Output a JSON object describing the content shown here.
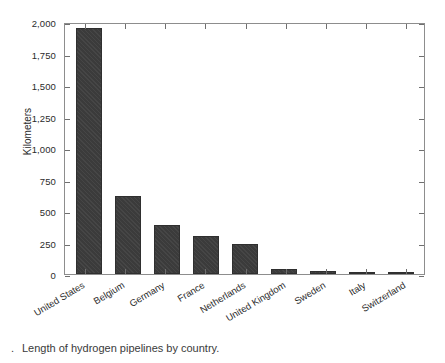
{
  "chart_data": {
    "type": "bar",
    "title": "",
    "xlabel": "",
    "ylabel": "Kilometers",
    "ylim": [
      0,
      2000
    ],
    "yticks": [
      0,
      250,
      500,
      750,
      1000,
      1250,
      1500,
      1750,
      2000
    ],
    "ytick_labels": [
      "0",
      "250",
      "500",
      "750",
      "1,000",
      "1,250",
      "1,500",
      "1,750",
      "2,000"
    ],
    "grid": false,
    "legend": "none",
    "bar_color": "#3b3b3b",
    "axis_color": "#8d8d8d",
    "categories": [
      "United States",
      "Belgium",
      "Germany",
      "France",
      "Netherlands",
      "United Kingdom",
      "Sweden",
      "Italy",
      "Switzerland"
    ],
    "values": [
      1950,
      620,
      390,
      305,
      240,
      40,
      20,
      10,
      1
    ]
  },
  "caption": {
    "marker": ".",
    "text": "Length of hydrogen pipelines by country."
  }
}
